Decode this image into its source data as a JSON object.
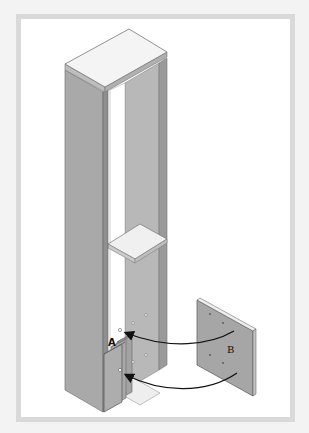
{
  "diagram": {
    "type": "assembly-instruction",
    "labels": {
      "part_a": "A",
      "part_b": "B"
    },
    "colors": {
      "panel_face": "#a9a9a9",
      "panel_edge": "#8a8a8a",
      "top_surface": "#f4f4f4",
      "shelf": "#f0f0f0",
      "frame_border": "#d9d9d9",
      "arrow": "#111111",
      "background": "#ffffff"
    },
    "arrows": [
      {
        "from": "B",
        "to": "A",
        "position": "upper"
      },
      {
        "from": "B",
        "to": "A",
        "position": "lower"
      }
    ]
  }
}
